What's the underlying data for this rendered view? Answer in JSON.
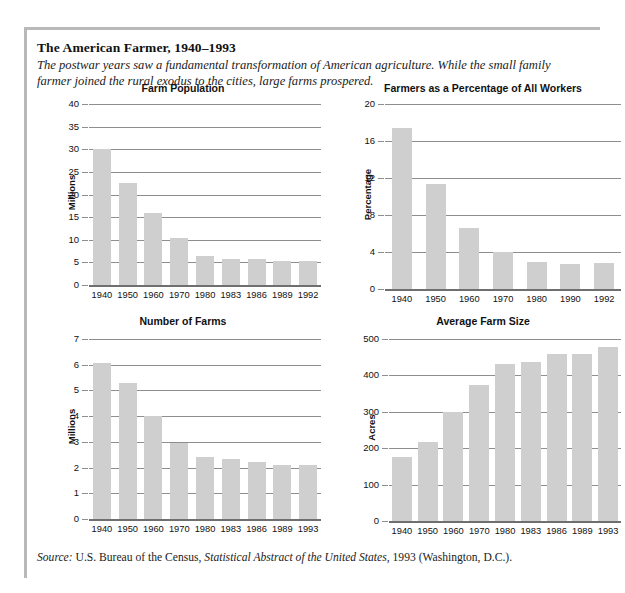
{
  "figure": {
    "title": "The American Farmer, 1940–1993",
    "subtitle": "The postwar years saw a fundamental transformation of American agriculture. While the small family farmer joined the rural exodus to the cities, large farms prospered.",
    "source_prefix": "Source:",
    "source_text_1": "U.S. Bureau of the Census,",
    "source_italic": "Statistical Abstract of the United States,",
    "source_text_2": "1993 (Washington, D.C.)."
  },
  "colors": {
    "bar_fill": "#cfcfcf",
    "gridline": "#8e8e8e",
    "axis": "#6f6f6f",
    "border": "#b9b9b9",
    "text": "#111111"
  },
  "chart_data": [
    {
      "id": "farm-population",
      "type": "bar",
      "title": "Farm Population",
      "xlabel": "",
      "ylabel": "Millions",
      "ylim": [
        0,
        40
      ],
      "yticks": [
        0,
        5,
        10,
        15,
        20,
        25,
        30,
        35,
        40
      ],
      "grid": true,
      "legend": "none",
      "categories": [
        "1940",
        "1950",
        "1960",
        "1970",
        "1980",
        "1983",
        "1986",
        "1989",
        "1992"
      ],
      "values": [
        30.0,
        22.5,
        16.0,
        10.4,
        6.5,
        5.8,
        5.8,
        5.4,
        5.3
      ]
    },
    {
      "id": "farmers-pct",
      "type": "bar",
      "title": "Farmers as a Percentage of All Workers",
      "xlabel": "",
      "ylabel": "Percentage",
      "ylim": [
        0,
        20
      ],
      "yticks": [
        0,
        4,
        8,
        12,
        16,
        20
      ],
      "grid": true,
      "legend": "none",
      "categories": [
        "1940",
        "1950",
        "1960",
        "1970",
        "1980",
        "1990",
        "1992"
      ],
      "values": [
        17.4,
        11.3,
        6.6,
        4.0,
        2.9,
        2.7,
        2.8
      ]
    },
    {
      "id": "number-farms",
      "type": "bar",
      "title": "Number of Farms",
      "xlabel": "",
      "ylabel": "Millions",
      "ylim": [
        0,
        7
      ],
      "yticks": [
        0,
        1,
        2,
        3,
        4,
        5,
        6,
        7
      ],
      "grid": true,
      "legend": "none",
      "categories": [
        "1940",
        "1950",
        "1960",
        "1970",
        "1980",
        "1983",
        "1986",
        "1989",
        "1993"
      ],
      "values": [
        6.05,
        5.3,
        4.0,
        2.95,
        2.4,
        2.35,
        2.2,
        2.1,
        2.1
      ]
    },
    {
      "id": "avg-farm-size",
      "type": "bar",
      "title": "Average Farm Size",
      "xlabel": "",
      "ylabel": "Acres",
      "ylim": [
        0,
        500
      ],
      "yticks": [
        0,
        100,
        200,
        300,
        400,
        500
      ],
      "grid": true,
      "legend": "none",
      "categories": [
        "1940",
        "1950",
        "1960",
        "1970",
        "1980",
        "1983",
        "1986",
        "1989",
        "1993"
      ],
      "values": [
        175,
        218,
        300,
        375,
        430,
        438,
        460,
        460,
        478
      ]
    }
  ]
}
